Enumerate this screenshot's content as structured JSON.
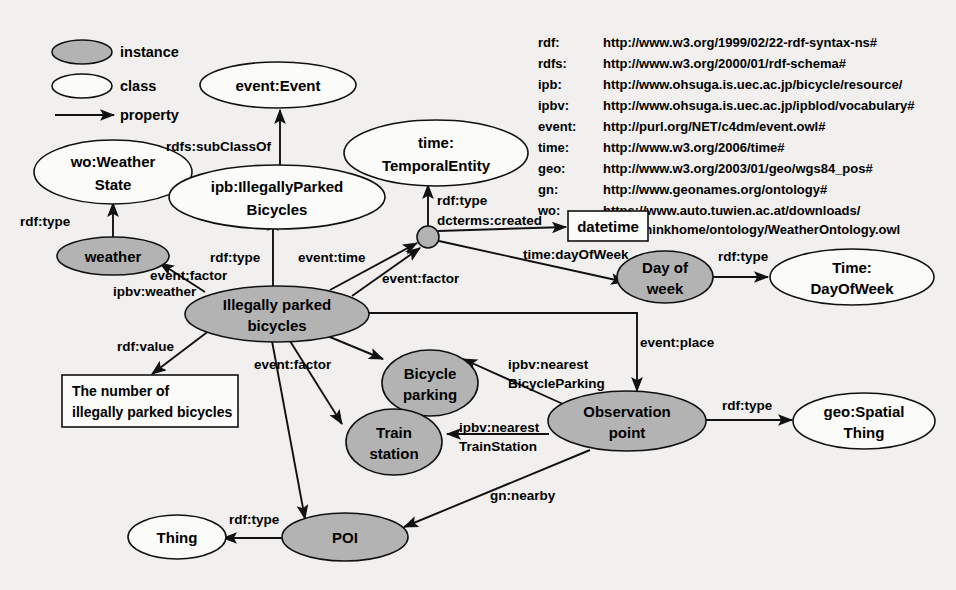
{
  "diagram": {
    "legend": {
      "items": [
        {
          "key": "instance",
          "label": "instance",
          "shape": "filled-ellipse",
          "color": "#b3b3b3"
        },
        {
          "key": "class",
          "label": "class",
          "shape": "hollow-ellipse",
          "color": "#ffffff"
        },
        {
          "key": "property",
          "label": "property",
          "shape": "arrow",
          "color": "#000000"
        }
      ]
    },
    "namespaces": [
      {
        "prefix": "rdf:",
        "uri": "http://www.w3.org/1999/02/22-rdf-syntax-ns#"
      },
      {
        "prefix": "rdfs:",
        "uri": "http://www.w3.org/2000/01/rdf-schema#"
      },
      {
        "prefix": "ipb:",
        "uri": "http://www.ohsuga.is.uec.ac.jp/bicycle/resource/"
      },
      {
        "prefix": "ipbv:",
        "uri": "http://www.ohsuga.is.uec.ac.jp/ipblod/vocabulary#"
      },
      {
        "prefix": "event:",
        "uri": "http://purl.org/NET/c4dm/event.owl#"
      },
      {
        "prefix": "time:",
        "uri": "http://www.w3.org/2006/time#"
      },
      {
        "prefix": "geo:",
        "uri": "http://www.w3.org/2003/01/geo/wgs84_pos#"
      },
      {
        "prefix": "gn:",
        "uri": "http://www.geonames.org/ontology#"
      },
      {
        "prefix": "wo:",
        "uri": "https://www.auto.tuwien.ac.at/downloads/",
        "uri2": "thinkhome/ontology/WeatherOntology.owl"
      }
    ],
    "nodes": [
      {
        "id": "event-event",
        "label_1": "event:Event",
        "label_2": "",
        "kind": "class"
      },
      {
        "id": "wo-weather-state",
        "label_1": "wo:Weather",
        "label_2": "State",
        "kind": "class"
      },
      {
        "id": "ipb-illegally-parked-bicycles",
        "label_1": "ipb:IllegallyParked",
        "label_2": "Bicycles",
        "kind": "class"
      },
      {
        "id": "time-temporal-entity",
        "label_1": "time:",
        "label_2": "TemporalEntity",
        "kind": "class"
      },
      {
        "id": "weather",
        "label_1": "weather",
        "label_2": "",
        "kind": "instance"
      },
      {
        "id": "illegally-parked-bicycles",
        "label_1": "Illegally parked",
        "label_2": "bicycles",
        "kind": "instance"
      },
      {
        "id": "blank-node",
        "label_1": "",
        "label_2": "",
        "kind": "blank"
      },
      {
        "id": "datetime",
        "label_1": "datetime",
        "label_2": "",
        "kind": "literal"
      },
      {
        "id": "day-of-week",
        "label_1": "Day of",
        "label_2": "week",
        "kind": "instance"
      },
      {
        "id": "time-dayofweek",
        "label_1": "Time:",
        "label_2": "DayOfWeek",
        "kind": "class"
      },
      {
        "id": "number-of-bicycles",
        "label_1": "The number of",
        "label_2": "illegally parked bicycles",
        "kind": "literal"
      },
      {
        "id": "bicycle-parking",
        "label_1": "Bicycle",
        "label_2": "parking",
        "kind": "instance"
      },
      {
        "id": "train-station",
        "label_1": "Train",
        "label_2": "station",
        "kind": "instance"
      },
      {
        "id": "observation-point",
        "label_1": "Observation",
        "label_2": "point",
        "kind": "instance"
      },
      {
        "id": "geo-spatial-thing",
        "label_1": "geo:Spatial",
        "label_2": "Thing",
        "kind": "class"
      },
      {
        "id": "poi",
        "label_1": "POI",
        "label_2": "",
        "kind": "instance"
      },
      {
        "id": "thing",
        "label_1": "Thing",
        "label_2": "",
        "kind": "class"
      }
    ],
    "edges": [
      {
        "id": "e1",
        "from": "ipb-illegally-parked-bicycles",
        "to": "event-event",
        "label": "rdfs:subClassOf"
      },
      {
        "id": "e2",
        "from": "weather",
        "to": "wo-weather-state",
        "label": "rdf:type"
      },
      {
        "id": "e3",
        "from": "illegally-parked-bicycles",
        "to": "ipb-illegally-parked-bicycles",
        "label": "rdf:type"
      },
      {
        "id": "e4",
        "from": "blank-node",
        "to": "time-temporal-entity",
        "label": "rdf:type"
      },
      {
        "id": "e5",
        "from": "blank-node",
        "to": "datetime",
        "label": "dcterms:created"
      },
      {
        "id": "e6",
        "from": "blank-node",
        "to": "day-of-week",
        "label": "time:dayOfWeek"
      },
      {
        "id": "e7",
        "from": "illegally-parked-bicycles",
        "to": "weather",
        "label": "event:factor",
        "label2": "ipbv:weather"
      },
      {
        "id": "e8",
        "from": "illegally-parked-bicycles",
        "to": "blank-node",
        "label": "event:time"
      },
      {
        "id": "e9",
        "from": "illegally-parked-bicycles",
        "to": "blank-node",
        "label": "event:factor"
      },
      {
        "id": "e10",
        "from": "day-of-week",
        "to": "time-dayofweek",
        "label": "rdf:type"
      },
      {
        "id": "e11",
        "from": "illegally-parked-bicycles",
        "to": "number-of-bicycles",
        "label": "rdf:value"
      },
      {
        "id": "e12",
        "from": "illegally-parked-bicycles",
        "to": "bicycle-parking",
        "label": "event:factor"
      },
      {
        "id": "e13",
        "from": "illegally-parked-bicycles",
        "to": "train-station",
        "label": ""
      },
      {
        "id": "e14",
        "from": "illegally-parked-bicycles",
        "to": "poi",
        "label": ""
      },
      {
        "id": "e15",
        "from": "illegally-parked-bicycles",
        "to": "observation-point",
        "label": "event:place"
      },
      {
        "id": "e16",
        "from": "observation-point",
        "to": "bicycle-parking",
        "label": "ipbv:nearest",
        "label2": "BicycleParking"
      },
      {
        "id": "e17",
        "from": "observation-point",
        "to": "train-station",
        "label": "ipbv:nearest",
        "label2": "TrainStation"
      },
      {
        "id": "e18",
        "from": "observation-point",
        "to": "geo-spatial-thing",
        "label": "rdf:type"
      },
      {
        "id": "e19",
        "from": "observation-point",
        "to": "poi",
        "label": "gn:nearby"
      },
      {
        "id": "e20",
        "from": "poi",
        "to": "thing",
        "label": "rdf:type"
      }
    ]
  }
}
